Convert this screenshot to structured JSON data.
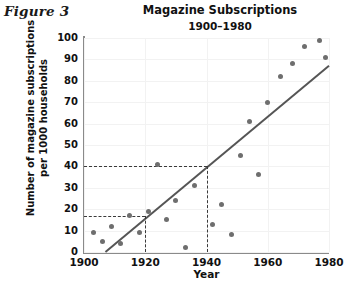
{
  "figure": {
    "label": "Figure 3"
  },
  "chart_data": {
    "type": "scatter",
    "title": "Magazine Subscriptions",
    "subtitle": "1900–1980",
    "xlabel": "Year",
    "ylabel": "Number of magazine subscriptions per 1000 households",
    "xlim": [
      1900,
      1980
    ],
    "ylim": [
      0,
      100
    ],
    "xticks": [
      1900,
      1920,
      1940,
      1960,
      1980
    ],
    "yticks": [
      0,
      10,
      20,
      30,
      40,
      50,
      60,
      70,
      80,
      90,
      100
    ],
    "grid": true,
    "legend": "none",
    "points": [
      {
        "x": 1903,
        "y": 9
      },
      {
        "x": 1906,
        "y": 5
      },
      {
        "x": 1909,
        "y": 12
      },
      {
        "x": 1912,
        "y": 4
      },
      {
        "x": 1915,
        "y": 17
      },
      {
        "x": 1918,
        "y": 9
      },
      {
        "x": 1921,
        "y": 19
      },
      {
        "x": 1924,
        "y": 41
      },
      {
        "x": 1927,
        "y": 15
      },
      {
        "x": 1930,
        "y": 24
      },
      {
        "x": 1933,
        "y": 2
      },
      {
        "x": 1936,
        "y": 31
      },
      {
        "x": 1942,
        "y": 13
      },
      {
        "x": 1945,
        "y": 22
      },
      {
        "x": 1948,
        "y": 8
      },
      {
        "x": 1951,
        "y": 45
      },
      {
        "x": 1954,
        "y": 61
      },
      {
        "x": 1957,
        "y": 36
      },
      {
        "x": 1960,
        "y": 70
      },
      {
        "x": 1964,
        "y": 82
      },
      {
        "x": 1968,
        "y": 88
      },
      {
        "x": 1972,
        "y": 96
      },
      {
        "x": 1977,
        "y": 99
      },
      {
        "x": 1979,
        "y": 91
      }
    ],
    "trend_line": {
      "x0": 1907,
      "y0": 0,
      "x1": 1980,
      "y1": 87
    },
    "reference_lines": [
      {
        "value_y": 40,
        "value_x": 1940,
        "style": "dashed"
      },
      {
        "value_y": 17,
        "value_x": 1920,
        "style": "dashed"
      }
    ]
  }
}
